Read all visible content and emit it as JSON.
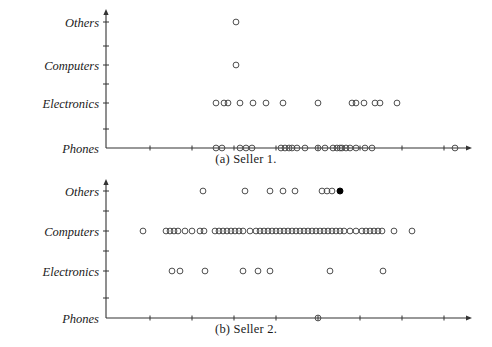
{
  "figure": {
    "type": "two-panel-strip-plot",
    "background": "#ffffff",
    "ink_color": "#333333",
    "marker_edge_color": "#444444",
    "marker_fill": "none",
    "highlight_marker_fill": "#000000"
  },
  "panels": [
    {
      "id": "a",
      "caption": "(a) Seller 1.",
      "categories": [
        "Phones",
        "Electronics",
        "Computers",
        "Others"
      ],
      "y_labels": {
        "phones": "Phones",
        "electronics": "Electronics",
        "computers": "Computers",
        "others": "Others"
      }
    },
    {
      "id": "b",
      "caption": "(b) Seller 2.",
      "categories": [
        "Phones",
        "Electronics",
        "Computers",
        "Others"
      ],
      "y_labels": {
        "phones": "Phones",
        "electronics": "Electronics",
        "computers": "Computers",
        "others": "Others"
      }
    }
  ],
  "chart_data": [
    {
      "type": "scatter",
      "title": "(a) Seller 1.",
      "xlabel": "",
      "ylabel": "",
      "grid": false,
      "legend": false,
      "axis_origin_px": {
        "x": 106,
        "y": 148
      },
      "axis_x_end_px": 466,
      "axis_y_top_px": 15,
      "categories": [
        "Phones",
        "Electronics",
        "Computers",
        "Others"
      ],
      "category_y_px": {
        "Phones": 148,
        "Electronics": 103,
        "Computers": 65,
        "Others": 22
      },
      "x_axis_ticks_px": [
        150,
        192,
        234,
        276,
        318,
        360,
        402,
        444
      ],
      "y_axis_ticks_px": [
        129,
        103,
        84,
        65,
        46,
        22
      ],
      "series": [
        {
          "name": "Others",
          "category": "Others",
          "marker": "open-circle",
          "x_px": [
            236
          ],
          "count": 1
        },
        {
          "name": "Computers",
          "category": "Computers",
          "marker": "open-circle",
          "x_px": [
            236
          ],
          "count": 1
        },
        {
          "name": "Electronics",
          "category": "Electronics",
          "marker": "open-circle",
          "x_px": [
            216,
            224,
            228,
            240,
            253,
            266,
            283,
            318,
            352,
            356,
            364,
            375,
            380,
            397
          ],
          "count": 14
        },
        {
          "name": "Phones",
          "category": "Phones",
          "marker": "open-circle",
          "x_px": [
            216,
            222,
            240,
            246,
            252,
            281,
            285,
            289,
            292,
            297,
            305,
            318,
            325,
            333,
            337,
            340,
            342,
            346,
            350,
            356,
            365,
            372,
            455
          ],
          "count": 23
        }
      ]
    },
    {
      "type": "scatter",
      "title": "(b) Seller 2.",
      "xlabel": "",
      "ylabel": "",
      "grid": false,
      "legend": false,
      "axis_origin_px": {
        "x": 106,
        "y": 318
      },
      "axis_x_end_px": 466,
      "axis_y_top_px": 185,
      "categories": [
        "Phones",
        "Electronics",
        "Computers",
        "Others"
      ],
      "category_y_px": {
        "Phones": 318,
        "Electronics": 271,
        "Computers": 231,
        "Others": 191
      },
      "x_axis_ticks_px": [
        150,
        192,
        234,
        276,
        318,
        360,
        402,
        444
      ],
      "y_axis_ticks_px": [
        298,
        271,
        251,
        231,
        211,
        191
      ],
      "series": [
        {
          "name": "Others",
          "category": "Others",
          "marker": "open-circle",
          "x_px": [
            203,
            245,
            270,
            283,
            295,
            322,
            327,
            332
          ],
          "count": 8,
          "highlight": {
            "x_px": 340,
            "marker": "filled-circle",
            "color": "#000000"
          }
        },
        {
          "name": "Computers",
          "category": "Computers",
          "marker": "open-circle",
          "x_px": [
            143,
            166,
            170,
            174,
            178,
            185,
            192,
            200,
            204,
            215,
            219,
            223,
            227,
            231,
            235,
            239,
            243,
            250,
            256,
            260,
            264,
            268,
            272,
            276,
            280,
            284,
            288,
            292,
            296,
            300,
            304,
            308,
            312,
            316,
            320,
            324,
            328,
            332,
            336,
            340,
            344,
            350,
            356,
            362,
            366,
            370,
            374,
            378,
            382,
            394,
            412
          ],
          "count": 51
        },
        {
          "name": "Electronics",
          "category": "Electronics",
          "marker": "open-circle",
          "x_px": [
            172,
            180,
            205,
            243,
            258,
            270,
            330,
            383
          ],
          "count": 8
        },
        {
          "name": "Phones",
          "category": "Phones",
          "marker": "open-circle",
          "x_px": [
            318
          ],
          "count": 1
        }
      ]
    }
  ]
}
